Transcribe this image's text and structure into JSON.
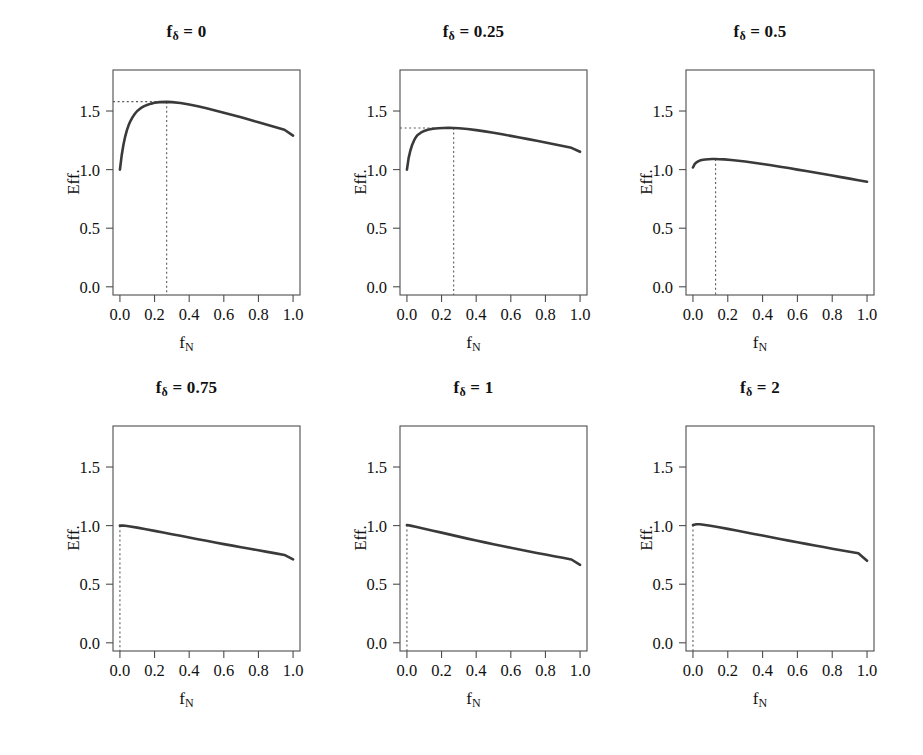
{
  "figure": {
    "rows": 2,
    "cols": 3,
    "line_color": "#3a3a3a",
    "axis_color": "#4d4d4d",
    "guide_color": "#5a5a5a",
    "background": "#ffffff"
  },
  "axis_titles": {
    "x_prefix": "f",
    "x_subscript": "N",
    "y": "Eff."
  },
  "title_parts": {
    "prefix": "f",
    "subscript": "δ",
    "equals": " = "
  },
  "chart_data": [
    {
      "type": "line",
      "title": "fδ = 0",
      "panel_param": "0",
      "xlabel": "fN",
      "ylabel": "Eff.",
      "xlim": [
        -0.04,
        1.04
      ],
      "ylim": [
        -0.07,
        1.85
      ],
      "xticks": [
        0.0,
        0.2,
        0.4,
        0.6,
        0.8,
        1.0
      ],
      "xtick_labels": [
        "0.0",
        "0.2",
        "0.4",
        "0.6",
        "0.8",
        "1.0"
      ],
      "yticks": [
        0.0,
        0.5,
        1.0,
        1.5
      ],
      "ytick_labels": [
        "0.0",
        "0.5",
        "1.0",
        "1.5"
      ],
      "grid": false,
      "legend": "none",
      "guides": {
        "vertical_x": 0.27,
        "horizontal_y": 1.58,
        "peak_marked": true
      },
      "x": [
        0.0,
        0.01,
        0.02,
        0.03,
        0.04,
        0.05,
        0.06,
        0.07,
        0.08,
        0.09,
        0.1,
        0.12,
        0.14,
        0.16,
        0.18,
        0.2,
        0.23,
        0.27,
        0.3,
        0.35,
        0.4,
        0.45,
        0.5,
        0.55,
        0.6,
        0.65,
        0.7,
        0.75,
        0.8,
        0.85,
        0.9,
        0.95,
        1.0
      ],
      "y": [
        1.0,
        1.12,
        1.21,
        1.28,
        1.335,
        1.378,
        1.412,
        1.44,
        1.463,
        1.483,
        1.5,
        1.524,
        1.542,
        1.554,
        1.563,
        1.57,
        1.576,
        1.578,
        1.576,
        1.568,
        1.556,
        1.541,
        1.524,
        1.505,
        1.486,
        1.466,
        1.446,
        1.425,
        1.404,
        1.383,
        1.362,
        1.34,
        1.29
      ]
    },
    {
      "type": "line",
      "title": "fδ = 0.25",
      "panel_param": "0.25",
      "xlabel": "fN",
      "ylabel": "Eff.",
      "xlim": [
        -0.04,
        1.04
      ],
      "ylim": [
        -0.07,
        1.85
      ],
      "xticks": [
        0.0,
        0.2,
        0.4,
        0.6,
        0.8,
        1.0
      ],
      "xtick_labels": [
        "0.0",
        "0.2",
        "0.4",
        "0.6",
        "0.8",
        "1.0"
      ],
      "yticks": [
        0.0,
        0.5,
        1.0,
        1.5
      ],
      "ytick_labels": [
        "0.0",
        "0.5",
        "1.0",
        "1.5"
      ],
      "grid": false,
      "legend": "none",
      "guides": {
        "vertical_x": 0.27,
        "horizontal_y": 1.355,
        "peak_marked": true
      },
      "x": [
        0.0,
        0.01,
        0.02,
        0.03,
        0.04,
        0.05,
        0.06,
        0.08,
        0.1,
        0.12,
        0.15,
        0.18,
        0.21,
        0.24,
        0.27,
        0.3,
        0.35,
        0.4,
        0.45,
        0.5,
        0.55,
        0.6,
        0.65,
        0.7,
        0.75,
        0.8,
        0.85,
        0.9,
        0.95,
        1.0
      ],
      "y": [
        1.0,
        1.1,
        1.163,
        1.21,
        1.245,
        1.272,
        1.293,
        1.315,
        1.33,
        1.34,
        1.349,
        1.353,
        1.355,
        1.356,
        1.355,
        1.353,
        1.346,
        1.337,
        1.326,
        1.314,
        1.301,
        1.288,
        1.274,
        1.26,
        1.246,
        1.232,
        1.217,
        1.202,
        1.186,
        1.152
      ]
    },
    {
      "type": "line",
      "title": "fδ = 0.5",
      "panel_param": "0.5",
      "xlabel": "fN",
      "ylabel": "Eff.",
      "xlim": [
        -0.04,
        1.04
      ],
      "ylim": [
        -0.07,
        1.85
      ],
      "xticks": [
        0.0,
        0.2,
        0.4,
        0.6,
        0.8,
        1.0
      ],
      "xtick_labels": [
        "0.0",
        "0.2",
        "0.4",
        "0.6",
        "0.8",
        "1.0"
      ],
      "yticks": [
        0.0,
        0.5,
        1.0,
        1.5
      ],
      "ytick_labels": [
        "0.0",
        "0.5",
        "1.0",
        "1.5"
      ],
      "grid": false,
      "legend": "none",
      "guides": {
        "vertical_x": 0.13,
        "horizontal_y": null,
        "peak_marked": true
      },
      "x": [
        0.0,
        0.01,
        0.02,
        0.03,
        0.04,
        0.05,
        0.07,
        0.09,
        0.11,
        0.13,
        0.15,
        0.18,
        0.22,
        0.26,
        0.3,
        0.35,
        0.4,
        0.45,
        0.5,
        0.55,
        0.6,
        0.65,
        0.7,
        0.75,
        0.8,
        0.85,
        0.9,
        0.95,
        1.0
      ],
      "y": [
        1.018,
        1.048,
        1.062,
        1.071,
        1.077,
        1.082,
        1.086,
        1.089,
        1.09,
        1.09,
        1.089,
        1.087,
        1.082,
        1.076,
        1.069,
        1.059,
        1.048,
        1.037,
        1.025,
        1.013,
        1.0,
        0.988,
        0.975,
        0.962,
        0.949,
        0.936,
        0.923,
        0.91,
        0.897
      ]
    },
    {
      "type": "line",
      "title": "fδ = 0.75",
      "panel_param": "0.75",
      "xlabel": "fN",
      "ylabel": "Eff.",
      "xlim": [
        -0.04,
        1.04
      ],
      "ylim": [
        -0.07,
        1.85
      ],
      "xticks": [
        0.0,
        0.2,
        0.4,
        0.6,
        0.8,
        1.0
      ],
      "xtick_labels": [
        "0.0",
        "0.2",
        "0.4",
        "0.6",
        "0.8",
        "1.0"
      ],
      "yticks": [
        0.0,
        0.5,
        1.0,
        1.5
      ],
      "ytick_labels": [
        "0.0",
        "0.5",
        "1.0",
        "1.5"
      ],
      "grid": false,
      "legend": "none",
      "guides": {
        "vertical_x": 0.0,
        "horizontal_y": null,
        "peak_marked": true
      },
      "x": [
        0.0,
        0.02,
        0.05,
        0.1,
        0.15,
        0.2,
        0.25,
        0.3,
        0.35,
        0.4,
        0.45,
        0.5,
        0.55,
        0.6,
        0.65,
        0.7,
        0.75,
        0.8,
        0.85,
        0.9,
        0.95,
        1.0
      ],
      "y": [
        1.0,
        1.001,
        0.995,
        0.983,
        0.969,
        0.955,
        0.941,
        0.927,
        0.913,
        0.898,
        0.884,
        0.87,
        0.856,
        0.842,
        0.829,
        0.815,
        0.802,
        0.789,
        0.776,
        0.763,
        0.75,
        0.712
      ]
    },
    {
      "type": "line",
      "title": "fδ = 1",
      "panel_param": "1",
      "xlabel": "fN",
      "ylabel": "Eff.",
      "xlim": [
        -0.04,
        1.04
      ],
      "ylim": [
        -0.07,
        1.85
      ],
      "xticks": [
        0.0,
        0.2,
        0.4,
        0.6,
        0.8,
        1.0
      ],
      "xtick_labels": [
        "0.0",
        "0.2",
        "0.4",
        "0.6",
        "0.8",
        "1.0"
      ],
      "yticks": [
        0.0,
        0.5,
        1.0,
        1.5
      ],
      "ytick_labels": [
        "0.0",
        "0.5",
        "1.0",
        "1.5"
      ],
      "grid": false,
      "legend": "none",
      "guides": {
        "vertical_x": 0.0,
        "horizontal_y": null,
        "peak_marked": true
      },
      "x": [
        0.0,
        0.02,
        0.05,
        0.1,
        0.15,
        0.2,
        0.25,
        0.3,
        0.35,
        0.4,
        0.45,
        0.5,
        0.55,
        0.6,
        0.65,
        0.7,
        0.75,
        0.8,
        0.85,
        0.9,
        0.95,
        1.0
      ],
      "y": [
        1.005,
        1.0,
        0.99,
        0.974,
        0.957,
        0.94,
        0.923,
        0.906,
        0.889,
        0.873,
        0.857,
        0.841,
        0.826,
        0.811,
        0.796,
        0.781,
        0.767,
        0.753,
        0.739,
        0.725,
        0.711,
        0.665
      ]
    },
    {
      "type": "line",
      "title": "fδ = 2",
      "panel_param": "2",
      "xlabel": "fN",
      "ylabel": "Eff.",
      "xlim": [
        -0.04,
        1.04
      ],
      "ylim": [
        -0.07,
        1.85
      ],
      "xticks": [
        0.0,
        0.2,
        0.4,
        0.6,
        0.8,
        1.0
      ],
      "xtick_labels": [
        "0.0",
        "0.2",
        "0.4",
        "0.6",
        "0.8",
        "1.0"
      ],
      "yticks": [
        0.0,
        0.5,
        1.0,
        1.5
      ],
      "ytick_labels": [
        "0.0",
        "0.5",
        "1.0",
        "1.5"
      ],
      "grid": false,
      "legend": "none",
      "guides": {
        "vertical_x": 0.0,
        "horizontal_y": null,
        "peak_marked": true
      },
      "x": [
        0.0,
        0.02,
        0.04,
        0.06,
        0.1,
        0.15,
        0.2,
        0.25,
        0.3,
        0.35,
        0.4,
        0.45,
        0.5,
        0.55,
        0.6,
        0.65,
        0.7,
        0.75,
        0.8,
        0.85,
        0.9,
        0.95,
        1.0
      ],
      "y": [
        1.005,
        1.012,
        1.011,
        1.008,
        0.999,
        0.986,
        0.972,
        0.958,
        0.944,
        0.929,
        0.915,
        0.9,
        0.886,
        0.872,
        0.858,
        0.844,
        0.83,
        0.817,
        0.803,
        0.79,
        0.777,
        0.764,
        0.7
      ]
    }
  ]
}
